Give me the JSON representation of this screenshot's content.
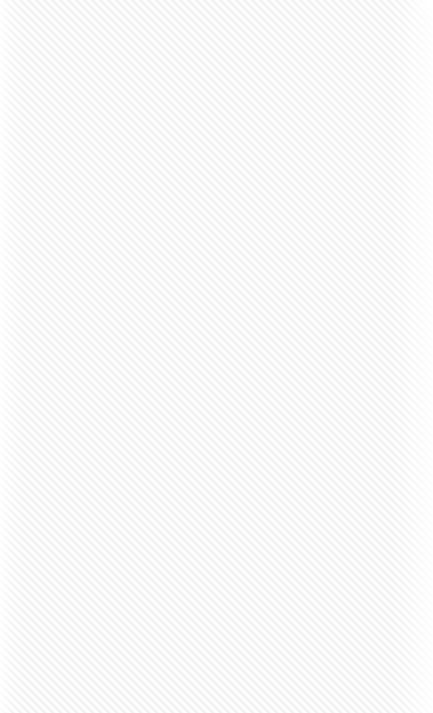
{
  "pane": {
    "name": "empty-content-pane",
    "width": 433,
    "height": 713,
    "state": "empty",
    "message": "",
    "background_color": "#ffffff"
  },
  "pattern": {
    "type": "diagonal-stripes",
    "angle_degrees": 45,
    "direction": "bottom-left-to-top-right",
    "period_px": 8,
    "stripe_color": "#eeeeee",
    "gap_color": "#ffffff",
    "midtone_color": "#f7f7f7"
  },
  "edges": {
    "left_fade_px": 10,
    "right_fade_px": 18,
    "corner_highlight": "top-right",
    "corner_radius_px": 6
  }
}
